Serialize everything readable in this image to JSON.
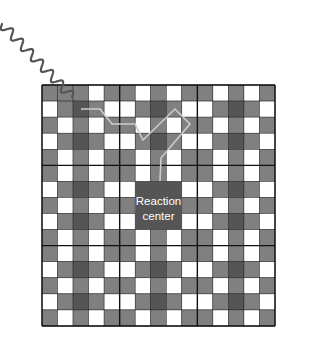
{
  "diagram": {
    "grid": {
      "x": 42,
      "y": 85,
      "width": 233,
      "height": 241,
      "cols": 15,
      "rows": 15,
      "block_size": 5,
      "block_rows": [
        [
          "G",
          "W",
          "G",
          "W",
          "G"
        ],
        [
          "W",
          "G",
          "D",
          "G",
          "W"
        ],
        [
          "G",
          "W",
          "G",
          "W",
          "G"
        ],
        [
          "W",
          "G",
          "D",
          "G",
          "W"
        ],
        [
          "G",
          "W",
          "G",
          "W",
          "G"
        ]
      ],
      "overrides": [
        {
          "row": 0,
          "col": 1,
          "value": "G"
        }
      ],
      "colors": {
        "G": "#808080",
        "W": "#ffffff",
        "D": "#555555",
        "cell_border": "#222222",
        "block_border": "#111111"
      }
    },
    "reaction_center": {
      "label_line1": "Reaction",
      "label_line2": "center",
      "col": 6,
      "row": 6,
      "col_span": 3,
      "row_span": 3,
      "color": "#555555",
      "text_color": "#ffffff"
    },
    "photon": {
      "description": "incoming light wave",
      "start": [
        2,
        24
      ],
      "end": [
        72,
        97
      ],
      "color": "#555555"
    },
    "energy_path": {
      "description": "exciton transfer path",
      "points": [
        [
          81,
          109
        ],
        [
          100,
          109
        ],
        [
          112,
          124
        ],
        [
          135,
          124
        ],
        [
          143,
          140
        ],
        [
          175,
          109
        ],
        [
          190,
          124
        ],
        [
          161,
          158
        ],
        [
          160,
          181
        ]
      ],
      "color": "#cccccc"
    }
  }
}
